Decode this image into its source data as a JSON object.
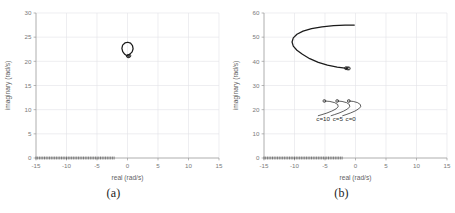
{
  "figure": {
    "panels": [
      {
        "id": "a",
        "caption": "(a)",
        "chart_data": {
          "type": "line",
          "title": "",
          "xlabel": "real (rad/s)",
          "ylabel": "imaginary (rad/s)",
          "xlim": [
            -15,
            15
          ],
          "ylim": [
            0,
            30
          ],
          "xticks": [
            -15,
            -10,
            -5,
            0,
            5,
            10,
            15
          ],
          "yticks": [
            0,
            5,
            10,
            15,
            20,
            25,
            30
          ],
          "xtick_labels": [
            "-15",
            "-10",
            "-5",
            "0",
            "5",
            "10",
            "15"
          ],
          "ytick_labels": [
            "0",
            "5",
            "10",
            "15",
            "20",
            "25",
            "30"
          ],
          "grid": true,
          "legend": "none",
          "series": [
            {
              "name": "root-locus-branch",
              "description": "small open C-shaped arc near origin",
              "points": [
                [
                  -0.1,
                  21.15
                ],
                [
                  -0.45,
                  21.45
                ],
                [
                  -0.78,
                  22.0
                ],
                [
                  -0.92,
                  22.7
                ],
                [
                  -0.8,
                  23.35
                ],
                [
                  -0.42,
                  23.8
                ],
                [
                  0.05,
                  23.95
                ],
                [
                  0.5,
                  23.75
                ],
                [
                  0.82,
                  23.25
                ],
                [
                  0.92,
                  22.6
                ],
                [
                  0.76,
                  21.95
                ],
                [
                  0.4,
                  21.5
                ],
                [
                  0.05,
                  21.25
                ]
              ],
              "markers": [
                [
                  0.18,
                  21.05
                ],
                [
                  0.3,
                  21.15
                ],
                [
                  0.05,
                  21.1
                ]
              ]
            }
          ],
          "axis_markers": {
            "description": "dense dashed marker row along y = 0",
            "y": 0,
            "x_start": -15,
            "x_end": -2.2
          }
        }
      },
      {
        "id": "b",
        "caption": "(b)",
        "chart_data": {
          "type": "line",
          "title": "",
          "xlabel": "real (rad/s)",
          "ylabel": "imaginary (rad/s)",
          "xlim": [
            -15,
            15
          ],
          "ylim": [
            0,
            60
          ],
          "xticks": [
            -15,
            -10,
            -5,
            0,
            5,
            10,
            15
          ],
          "yticks": [
            0,
            10,
            20,
            30,
            40,
            50,
            60
          ],
          "xtick_labels": [
            "-15",
            "-10",
            "-5",
            "0",
            "5",
            "10",
            "15"
          ],
          "ytick_labels": [
            "0",
            "10",
            "20",
            "30",
            "40",
            "50",
            "60"
          ],
          "grid": true,
          "legend": "inline-annotations",
          "series": [
            {
              "name": "large-locus-branch",
              "description": "large C-shaped branch opening to the right",
              "points": [
                [
                  -1.4,
                  37.1
                ],
                [
                  -3.0,
                  37.6
                ],
                [
                  -4.6,
                  38.4
                ],
                [
                  -6.1,
                  39.6
                ],
                [
                  -7.5,
                  41.1
                ],
                [
                  -8.7,
                  42.9
                ],
                [
                  -9.6,
                  44.6
                ],
                [
                  -10.2,
                  46.3
                ],
                [
                  -10.4,
                  48.0
                ],
                [
                  -10.2,
                  49.7
                ],
                [
                  -9.6,
                  51.2
                ],
                [
                  -8.6,
                  52.5
                ],
                [
                  -7.2,
                  53.55
                ],
                [
                  -5.5,
                  54.3
                ],
                [
                  -3.6,
                  54.75
                ],
                [
                  -1.7,
                  54.95
                ],
                [
                  -0.2,
                  55.0
                ]
              ],
              "markers": [
                [
                  -1.3,
                  37.1
                ],
                [
                  -1.55,
                  37.15
                ],
                [
                  -1.1,
                  37.05
                ]
              ]
            },
            {
              "name": "hook-branch-c10",
              "label": "c=10",
              "points": [
                [
                  -5.1,
                  23.6
                ],
                [
                  -4.2,
                  23.4
                ],
                [
                  -3.4,
                  22.9
                ],
                [
                  -2.9,
                  22.1
                ],
                [
                  -2.85,
                  21.2
                ],
                [
                  -3.2,
                  20.3
                ],
                [
                  -3.9,
                  19.4
                ],
                [
                  -4.7,
                  18.6
                ],
                [
                  -5.5,
                  17.95
                ],
                [
                  -6.1,
                  17.5
                ]
              ],
              "marker": [
                -5.1,
                23.6
              ]
            },
            {
              "name": "hook-branch-c5",
              "label": "c=5",
              "points": [
                [
                  -3.0,
                  23.6
                ],
                [
                  -2.2,
                  23.4
                ],
                [
                  -1.45,
                  22.9
                ],
                [
                  -1.0,
                  22.1
                ],
                [
                  -0.95,
                  21.2
                ],
                [
                  -1.3,
                  20.3
                ],
                [
                  -1.95,
                  19.4
                ],
                [
                  -2.7,
                  18.6
                ],
                [
                  -3.45,
                  17.95
                ],
                [
                  -4.0,
                  17.5
                ]
              ],
              "marker": [
                -3.0,
                23.6
              ]
            },
            {
              "name": "hook-branch-c0",
              "label": "c=0",
              "points": [
                [
                  -1.1,
                  23.6
                ],
                [
                  -0.35,
                  23.4
                ],
                [
                  0.35,
                  22.9
                ],
                [
                  0.8,
                  22.1
                ],
                [
                  0.85,
                  21.2
                ],
                [
                  0.5,
                  20.3
                ],
                [
                  -0.1,
                  19.4
                ],
                [
                  -0.85,
                  18.6
                ],
                [
                  -1.55,
                  17.95
                ],
                [
                  -2.1,
                  17.5
                ]
              ],
              "marker": [
                -1.1,
                23.6
              ]
            }
          ],
          "annotations": [
            {
              "text": "c=10",
              "x": -5.3,
              "y": 15.4
            },
            {
              "text": "c=5",
              "x": -2.9,
              "y": 15.4
            },
            {
              "text": "c=0",
              "x": -0.8,
              "y": 15.4
            }
          ],
          "axis_markers": {
            "description": "dense dashed marker row along y = 0",
            "y": 0,
            "x_start": -15,
            "x_end": -2.2
          }
        }
      }
    ]
  },
  "colors": {
    "background": "#ffffff",
    "curve": "#1a1a1a",
    "grid": "#e3e3e8",
    "axis": "#9a9a9a",
    "tick_text": "#7a7a7a",
    "caption_text": "#1c1c1c"
  }
}
